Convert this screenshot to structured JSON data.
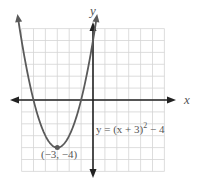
{
  "chart_data": {
    "type": "line",
    "title": "",
    "xlabel": "x",
    "ylabel": "y",
    "xlim": [
      -6,
      6
    ],
    "ylim": [
      -6,
      6
    ],
    "grid": true,
    "function": "y = (x + 3)^2 - 4",
    "series": [
      {
        "name": "y = (x + 3)^2 - 4",
        "x": [
          -6,
          -5.5,
          -5,
          -4.5,
          -4,
          -3.5,
          -3,
          -2.5,
          -2,
          -1.5,
          -1,
          -0.5,
          0
        ],
        "y": [
          5,
          2.25,
          0,
          -1.75,
          -3,
          -3.75,
          -4,
          -3.75,
          -3,
          -1.75,
          0,
          2.25,
          5
        ]
      }
    ],
    "annotations": [
      {
        "text": "(−3, −4)",
        "x": -3,
        "y": -4,
        "kind": "vertex"
      },
      {
        "text": "y = (x + 3)² − 4",
        "kind": "equation-label"
      }
    ]
  },
  "labels": {
    "x_axis": "x",
    "y_axis": "y",
    "vertex": "(−3, −4)",
    "equation_main": "y = (x + 3)",
    "equation_exp": "2",
    "equation_tail": " − 4"
  },
  "colors": {
    "curve": "#5a5a5a",
    "axis": "#222222",
    "grid": "#d4d4d4"
  }
}
